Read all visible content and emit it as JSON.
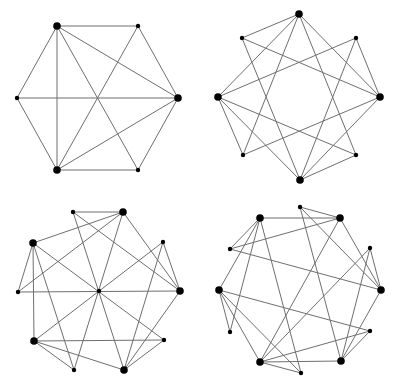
{
  "figure": {
    "width": 399,
    "height": 389,
    "edge_color": "#6f6f6f",
    "node_color": "#000000",
    "big_radius": 3.8,
    "small_radius": 2.2
  },
  "graphs": [
    {
      "id": "graph-top-left",
      "nodes": [
        {
          "x": 57,
          "y": 26,
          "big": true
        },
        {
          "x": 138,
          "y": 26,
          "big": false
        },
        {
          "x": 178,
          "y": 98,
          "big": true
        },
        {
          "x": 138,
          "y": 170,
          "big": false
        },
        {
          "x": 57,
          "y": 170,
          "big": true
        },
        {
          "x": 17,
          "y": 98,
          "big": false
        }
      ],
      "edges": [
        [
          0,
          1
        ],
        [
          1,
          2
        ],
        [
          2,
          3
        ],
        [
          3,
          4
        ],
        [
          4,
          5
        ],
        [
          5,
          0
        ],
        [
          0,
          4
        ],
        [
          0,
          2
        ],
        [
          0,
          3
        ],
        [
          1,
          4
        ],
        [
          5,
          2
        ],
        [
          4,
          2
        ]
      ]
    },
    {
      "id": "graph-top-right",
      "nodes": [
        {
          "x": 299,
          "y": 14,
          "big": true
        },
        {
          "x": 356,
          "y": 38,
          "big": false
        },
        {
          "x": 380,
          "y": 97,
          "big": true
        },
        {
          "x": 356,
          "y": 155,
          "big": false
        },
        {
          "x": 300,
          "y": 180,
          "big": true
        },
        {
          "x": 243,
          "y": 155,
          "big": false
        },
        {
          "x": 218,
          "y": 97,
          "big": true
        },
        {
          "x": 242,
          "y": 38,
          "big": false
        }
      ],
      "edges": [
        [
          0,
          7
        ],
        [
          0,
          6
        ],
        [
          0,
          5
        ],
        [
          0,
          3
        ],
        [
          0,
          2
        ],
        [
          7,
          2
        ],
        [
          7,
          4
        ],
        [
          1,
          6
        ],
        [
          1,
          2
        ],
        [
          1,
          4
        ],
        [
          6,
          5
        ],
        [
          6,
          4
        ],
        [
          6,
          3
        ],
        [
          2,
          5
        ],
        [
          2,
          4
        ],
        [
          4,
          3
        ]
      ]
    },
    {
      "id": "graph-bottom-left",
      "nodes": [
        {
          "x": 73,
          "y": 212,
          "big": false
        },
        {
          "x": 123,
          "y": 212,
          "big": true
        },
        {
          "x": 33,
          "y": 243,
          "big": true
        },
        {
          "x": 163,
          "y": 242,
          "big": false
        },
        {
          "x": 18,
          "y": 292,
          "big": false
        },
        {
          "x": 180,
          "y": 291,
          "big": true
        },
        {
          "x": 34,
          "y": 341,
          "big": true
        },
        {
          "x": 164,
          "y": 340,
          "big": false
        },
        {
          "x": 74,
          "y": 370,
          "big": false
        },
        {
          "x": 124,
          "y": 370,
          "big": true
        },
        {
          "x": 99,
          "y": 291,
          "big": false,
          "center": true
        }
      ],
      "edges": [
        [
          0,
          1
        ],
        [
          0,
          5
        ],
        [
          0,
          9
        ],
        [
          1,
          2
        ],
        [
          1,
          4
        ],
        [
          1,
          5
        ],
        [
          1,
          8
        ],
        [
          2,
          4
        ],
        [
          2,
          6
        ],
        [
          2,
          7
        ],
        [
          2,
          8
        ],
        [
          3,
          5
        ],
        [
          3,
          6
        ],
        [
          3,
          9
        ],
        [
          4,
          5
        ],
        [
          6,
          7
        ],
        [
          6,
          8
        ],
        [
          6,
          9
        ],
        [
          7,
          9
        ],
        [
          5,
          9
        ]
      ]
    },
    {
      "id": "graph-bottom-right",
      "nodes": [
        {
          "x": 300,
          "y": 207,
          "big": false
        },
        {
          "x": 340,
          "y": 218,
          "big": true
        },
        {
          "x": 370,
          "y": 248,
          "big": false
        },
        {
          "x": 381,
          "y": 290,
          "big": true
        },
        {
          "x": 370,
          "y": 331,
          "big": false
        },
        {
          "x": 341,
          "y": 361,
          "big": true
        },
        {
          "x": 301,
          "y": 373,
          "big": false
        },
        {
          "x": 260,
          "y": 362,
          "big": true
        },
        {
          "x": 230,
          "y": 332,
          "big": false
        },
        {
          "x": 219,
          "y": 290,
          "big": true
        },
        {
          "x": 230,
          "y": 249,
          "big": false
        },
        {
          "x": 260,
          "y": 218,
          "big": true
        }
      ],
      "edges": [
        [
          0,
          1
        ],
        [
          0,
          3
        ],
        [
          0,
          5
        ],
        [
          1,
          11
        ],
        [
          1,
          10
        ],
        [
          1,
          3
        ],
        [
          1,
          7
        ],
        [
          2,
          3
        ],
        [
          2,
          5
        ],
        [
          2,
          7
        ],
        [
          3,
          5
        ],
        [
          3,
          10
        ],
        [
          4,
          5
        ],
        [
          4,
          9
        ],
        [
          4,
          7
        ],
        [
          5,
          7
        ],
        [
          6,
          7
        ],
        [
          6,
          11
        ],
        [
          6,
          9
        ],
        [
          7,
          9
        ],
        [
          8,
          9
        ],
        [
          8,
          11
        ],
        [
          9,
          11
        ],
        [
          10,
          11
        ]
      ]
    }
  ]
}
